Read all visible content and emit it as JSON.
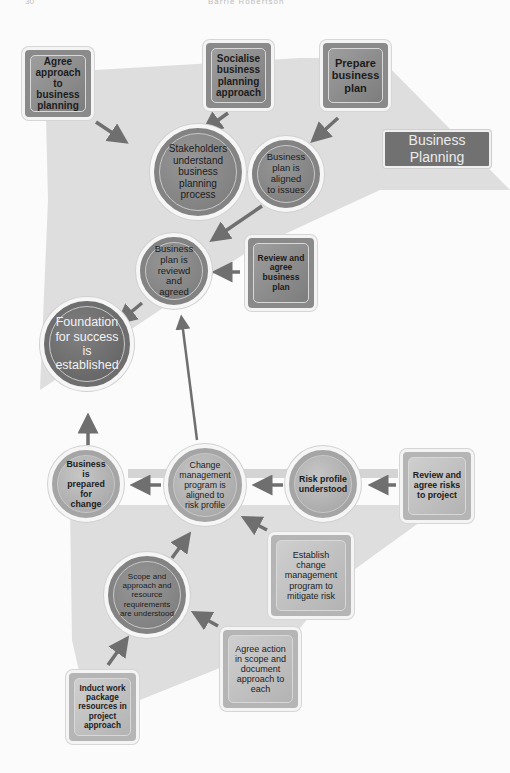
{
  "header": {
    "page_number": "30",
    "running_title": "Barrie Robertson"
  },
  "legend": {
    "label": "Business Planning"
  },
  "nodes": {
    "agree_approach": "Agree approach to business planning",
    "socialise": "Socialise business planning approach",
    "prepare_plan": "Prepare business plan",
    "stakeholders": "Stakeholders understand business planning process",
    "plan_aligned": "Business plan is aligned to issues",
    "plan_reviewed": "Business plan is reviewd and agreed",
    "review_plan": "Review and agree business plan",
    "foundation": "Foundation for success is established",
    "business_prepared": "Business is prepared for change",
    "change_program": "Change management program is aligned to risk profile",
    "risk_profile": "Risk profile understood",
    "review_risks": "Review and agree risks to project",
    "establish_change": "Establish change management program to mitigate risk",
    "scope": "Scope and approach and resource requirements are understood",
    "agree_action": "Agree action in scope and document approach to each",
    "induct": "Induct work package resources in project approach"
  },
  "colors": {
    "region_fill": "#d9d9d9",
    "arrow": "#6f6f6f",
    "label_fill": "#717171",
    "dark_node": "#838383",
    "light_node": "#a5a5a5"
  }
}
